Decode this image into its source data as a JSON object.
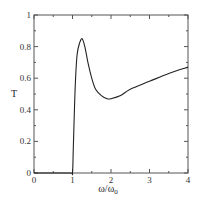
{
  "chart_data": {
    "type": "line",
    "title": "",
    "xlabel": "ω/ω",
    "xlabel_sub": "0",
    "ylabel": "T",
    "xlim": [
      0,
      4
    ],
    "ylim": [
      0,
      1
    ],
    "grid": false,
    "legend": null,
    "x_ticks": [
      0,
      1,
      2,
      3,
      4
    ],
    "x_tick_labels": [
      "0",
      "1",
      "2",
      "3",
      "4"
    ],
    "y_ticks": [
      0,
      0.2,
      0.4,
      0.6,
      0.8,
      1
    ],
    "y_tick_labels": [
      "0",
      "0.2",
      "0.4",
      "0.6",
      "0.8",
      "1"
    ],
    "series": [
      {
        "name": "T",
        "color": "#222222",
        "x": [
          0,
          0.5,
          0.95,
          1.0,
          1.02,
          1.05,
          1.08,
          1.12,
          1.18,
          1.25,
          1.32,
          1.4,
          1.5,
          1.6,
          1.75,
          1.9,
          2.0,
          2.25,
          2.5,
          3.0,
          3.5,
          4.0
        ],
        "y": [
          0,
          0,
          0,
          0,
          0.15,
          0.4,
          0.6,
          0.75,
          0.82,
          0.85,
          0.8,
          0.7,
          0.6,
          0.53,
          0.49,
          0.47,
          0.47,
          0.49,
          0.53,
          0.58,
          0.63,
          0.67
        ]
      }
    ]
  }
}
